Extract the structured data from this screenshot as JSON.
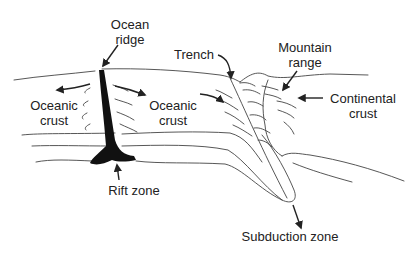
{
  "diagram": {
    "labels": {
      "ocean_ridge_line1": "Ocean",
      "ocean_ridge_line2": "ridge",
      "oceanic_crust_left_line1": "Oceanic",
      "oceanic_crust_left_line2": "crust",
      "oceanic_crust_right_line1": "Oceanic",
      "oceanic_crust_right_line2": "crust",
      "trench": "Trench",
      "mountain_range_line1": "Mountain",
      "mountain_range_line2": "range",
      "continental_crust_line1": "Continental",
      "continental_crust_line2": "crust",
      "rift_zone": "Rift zone",
      "subduction_zone": "Subduction zone"
    },
    "colors": {
      "line": "#444444",
      "magma": "#111111",
      "text": "#222222",
      "background": "#ffffff"
    }
  }
}
